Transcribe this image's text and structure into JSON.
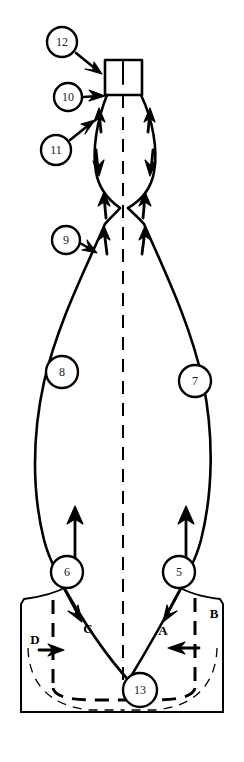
{
  "figure": {
    "background_color": "#ffffff",
    "line_color": "#000000",
    "width": 244,
    "height": 762
  },
  "callouts": [
    {
      "id": "12",
      "label": "12",
      "cx": 62,
      "cy": 42,
      "r": 15,
      "leader": "arrow to neck top-left corner"
    },
    {
      "id": "10",
      "label": "10",
      "cx": 68,
      "cy": 97,
      "r": 14,
      "leader": "arrow to neck base left"
    },
    {
      "id": "11",
      "label": "11",
      "cx": 56,
      "cy": 150,
      "r": 15,
      "leader": "arrow up-right to upper bulb left wall"
    },
    {
      "id": "9",
      "label": "9",
      "cx": 66,
      "cy": 240,
      "r": 14,
      "leader": "arrow right to waist left wall"
    },
    {
      "id": "8",
      "label": "8",
      "cx": 62,
      "cy": 372,
      "r": 16,
      "leader": "none"
    },
    {
      "id": "7",
      "label": "7",
      "cx": 195,
      "cy": 381,
      "r": 16,
      "leader": "none"
    },
    {
      "id": "6",
      "label": "6",
      "cx": 67,
      "cy": 572,
      "r": 16,
      "leader": "up arrow from circle top"
    },
    {
      "id": "5",
      "label": "5",
      "cx": 179,
      "cy": 572,
      "r": 16,
      "leader": "up arrow from circle top"
    },
    {
      "id": "13",
      "label": "13",
      "cx": 140,
      "cy": 690,
      "r": 17,
      "leader": "none"
    }
  ],
  "section_letters": [
    {
      "id": "A",
      "label": "A",
      "x": 163,
      "y": 630,
      "note": "down-left flow arrow on right diagonal"
    },
    {
      "id": "B",
      "label": "B",
      "x": 214,
      "y": 613,
      "note": "left-pointing arrow near right dashed vertical"
    },
    {
      "id": "C",
      "label": "C",
      "x": 88,
      "y": 628,
      "note": "down-right flow arrow on left diagonal"
    },
    {
      "id": "D",
      "label": "D",
      "x": 35,
      "y": 639,
      "note": "right-pointing arrow near left dashed vertical"
    }
  ],
  "flow_arrows": [
    {
      "id": "neck-left-up",
      "direction": "up",
      "region": "upper bulb left wall"
    },
    {
      "id": "neck-right-up",
      "direction": "up",
      "region": "upper bulb right wall"
    },
    {
      "id": "bulb-left-down",
      "direction": "down",
      "region": "upper bulb left wall mid"
    },
    {
      "id": "bulb-right-down",
      "direction": "down",
      "region": "upper bulb right wall mid"
    },
    {
      "id": "waist-left-up-outer",
      "direction": "up",
      "region": "waist left outer"
    },
    {
      "id": "waist-left-up-inner",
      "direction": "up",
      "region": "waist left inner"
    },
    {
      "id": "waist-right-up-outer",
      "direction": "up",
      "region": "waist right outer"
    },
    {
      "id": "waist-right-up-inner",
      "direction": "up",
      "region": "waist right inner"
    },
    {
      "id": "body-left-up",
      "direction": "up",
      "region": "lower body left, at callout 6"
    },
    {
      "id": "body-right-up",
      "direction": "up",
      "region": "lower body right, at callout 5"
    },
    {
      "id": "base-left-diagonal",
      "direction": "down-right",
      "region": "base left diagonal, section C"
    },
    {
      "id": "base-right-diagonal",
      "direction": "down-left",
      "region": "base right diagonal, section A"
    },
    {
      "id": "base-left-inward",
      "direction": "right",
      "region": "base left interior, section D"
    },
    {
      "id": "base-right-inward",
      "direction": "left",
      "region": "base right interior, section B"
    }
  ]
}
